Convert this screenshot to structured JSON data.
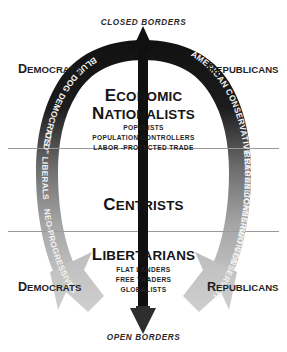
{
  "figure": {
    "type": "horseshoe-political-spectrum-diagram",
    "axis": {
      "top_label": "CLOSED BORDERS",
      "bottom_label": "OPEN BORDERS"
    },
    "side_labels": {
      "left_top": {
        "cap": "D",
        "rest": "EMOCRATS"
      },
      "right_top": {
        "cap": "R",
        "rest": "EPUBLICANS"
      },
      "left_bottom": {
        "cap": "D",
        "rest": "EMOCRATS"
      },
      "right_bottom": {
        "cap": "R",
        "rest": "EPUBLICANS"
      }
    },
    "bands": [
      {
        "id": "economic-nationalists",
        "title_line1": {
          "cap": "E",
          "rest": "CONOMIC"
        },
        "title_line2": {
          "cap": "N",
          "rest": "ATIONALISTS"
        },
        "subitems": [
          "POPULISTS",
          "POPULATION CONTROLLERS",
          "LABOR -PROTECTED TRADE"
        ]
      },
      {
        "id": "centrists",
        "title_line1": {
          "cap": "C",
          "rest": "ENTRISTS"
        },
        "subitems": []
      },
      {
        "id": "libertarians",
        "title_line1": {
          "cap": "L",
          "rest": "IBERTARIANS"
        },
        "subitems": [
          "FLAT LANDERS",
          "FREE TRADERS",
          "GLOBALISTS"
        ]
      }
    ],
    "arc_labels": {
      "left_upper": "BLUE DOG DEMOCRATS",
      "left_middle": "\"OLD\" LIBERALS",
      "left_lower": "NEO-PROGRESSIVES",
      "right_upper": "AMERICAN CONSERVATIVE REPUBLICANS",
      "right_middle": "REAGAN CONSERVATIVES",
      "right_lower": "NEO CONSERVATIVES"
    },
    "colors": {
      "arc_top": "#141414",
      "arc_mid": "#6f6f6f",
      "arc_bottom": "#c2c2c2",
      "center_arrow": "#111111",
      "divider_line": "#9a9a9a",
      "background": "#ffffff",
      "text": "#1a1a1a"
    }
  }
}
